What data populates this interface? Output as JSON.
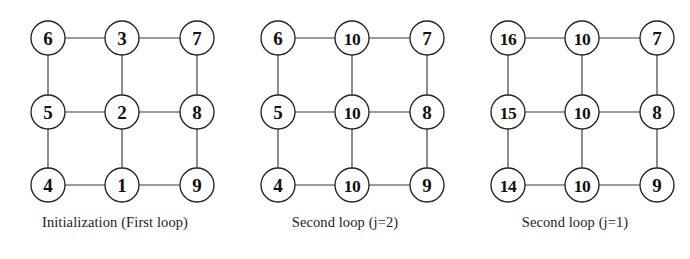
{
  "figure": {
    "background_color": "#ffffff",
    "node_fill_color": "#ffffff",
    "node_stroke_color": "#232323",
    "edge_color": "#3a3a3a",
    "label_color": "#111111"
  },
  "graph_layout": {
    "rows": 3,
    "cols": 3,
    "node_radius": 17,
    "col_x": [
      48,
      122,
      197
    ],
    "row_y": [
      38,
      112,
      185
    ],
    "edges": [
      [
        0,
        1
      ],
      [
        1,
        2
      ],
      [
        3,
        4
      ],
      [
        4,
        5
      ],
      [
        6,
        7
      ],
      [
        7,
        8
      ],
      [
        0,
        3
      ],
      [
        3,
        6
      ],
      [
        1,
        4
      ],
      [
        4,
        7
      ],
      [
        2,
        5
      ],
      [
        5,
        8
      ]
    ]
  },
  "panels": [
    {
      "id": "panel-initialization",
      "caption": "Initialization (First loop)",
      "nodes": [
        {
          "position": "top-left",
          "label": "6"
        },
        {
          "position": "top-center",
          "label": "3"
        },
        {
          "position": "top-right",
          "label": "7"
        },
        {
          "position": "middle-left",
          "label": "5"
        },
        {
          "position": "middle-center",
          "label": "2"
        },
        {
          "position": "middle-right",
          "label": "8"
        },
        {
          "position": "bottom-left",
          "label": "4"
        },
        {
          "position": "bottom-center",
          "label": "1"
        },
        {
          "position": "bottom-right",
          "label": "9"
        }
      ]
    },
    {
      "id": "panel-second-loop-j2",
      "caption": "Second loop (j=2)",
      "nodes": [
        {
          "position": "top-left",
          "label": "6"
        },
        {
          "position": "top-center",
          "label": "10"
        },
        {
          "position": "top-right",
          "label": "7"
        },
        {
          "position": "middle-left",
          "label": "5"
        },
        {
          "position": "middle-center",
          "label": "10"
        },
        {
          "position": "middle-right",
          "label": "8"
        },
        {
          "position": "bottom-left",
          "label": "4"
        },
        {
          "position": "bottom-center",
          "label": "10"
        },
        {
          "position": "bottom-right",
          "label": "9"
        }
      ]
    },
    {
      "id": "panel-second-loop-j1",
      "caption": "Second loop (j=1)",
      "nodes": [
        {
          "position": "top-left",
          "label": "16"
        },
        {
          "position": "top-center",
          "label": "10"
        },
        {
          "position": "top-right",
          "label": "7"
        },
        {
          "position": "middle-left",
          "label": "15"
        },
        {
          "position": "middle-center",
          "label": "10"
        },
        {
          "position": "middle-right",
          "label": "8"
        },
        {
          "position": "bottom-left",
          "label": "14"
        },
        {
          "position": "bottom-center",
          "label": "10"
        },
        {
          "position": "bottom-right",
          "label": "9"
        }
      ]
    }
  ]
}
